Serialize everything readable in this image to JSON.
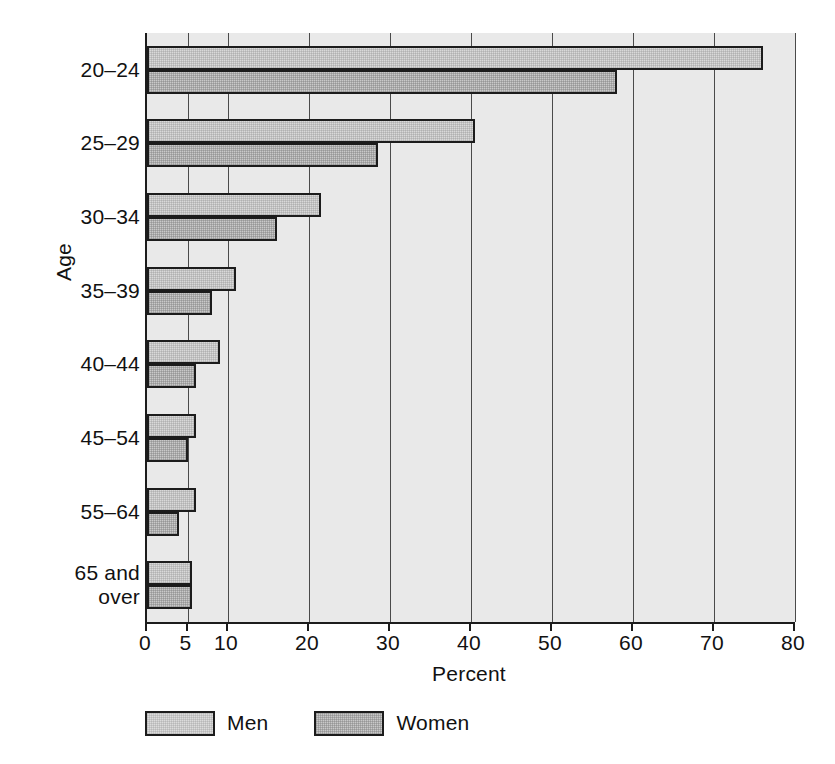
{
  "chart_data": {
    "type": "bar",
    "orientation": "horizontal",
    "grouped": true,
    "title": "",
    "xlabel": "Percent",
    "ylabel": "Age",
    "xlim": [
      0,
      80
    ],
    "ylim": null,
    "grid": true,
    "grid_axis": "x",
    "legend_position": "bottom-left",
    "categories": [
      "20–24",
      "25–29",
      "30–34",
      "35–39",
      "40–44",
      "45–54",
      "55–64",
      "65 and\nover"
    ],
    "xticks": [
      0,
      5,
      10,
      20,
      30,
      40,
      50,
      60,
      70,
      80
    ],
    "xticklabels": [
      "0",
      "5",
      "10",
      "20",
      "30",
      "40",
      "50",
      "60",
      "70",
      "80"
    ],
    "series": [
      {
        "name": "Men",
        "color": "#d9d9d9",
        "values": [
          76,
          40.5,
          21.5,
          11,
          9,
          6,
          6,
          5.5
        ]
      },
      {
        "name": "Women",
        "color": "#c9c9c9",
        "values": [
          58,
          28.5,
          16,
          8,
          6,
          5,
          4,
          5.5
        ]
      }
    ]
  },
  "axes": {
    "y_title": "Age",
    "x_title": "Percent"
  },
  "legend": {
    "entries": [
      {
        "label": "Men",
        "swatch": "men"
      },
      {
        "label": "Women",
        "swatch": "women"
      }
    ]
  }
}
